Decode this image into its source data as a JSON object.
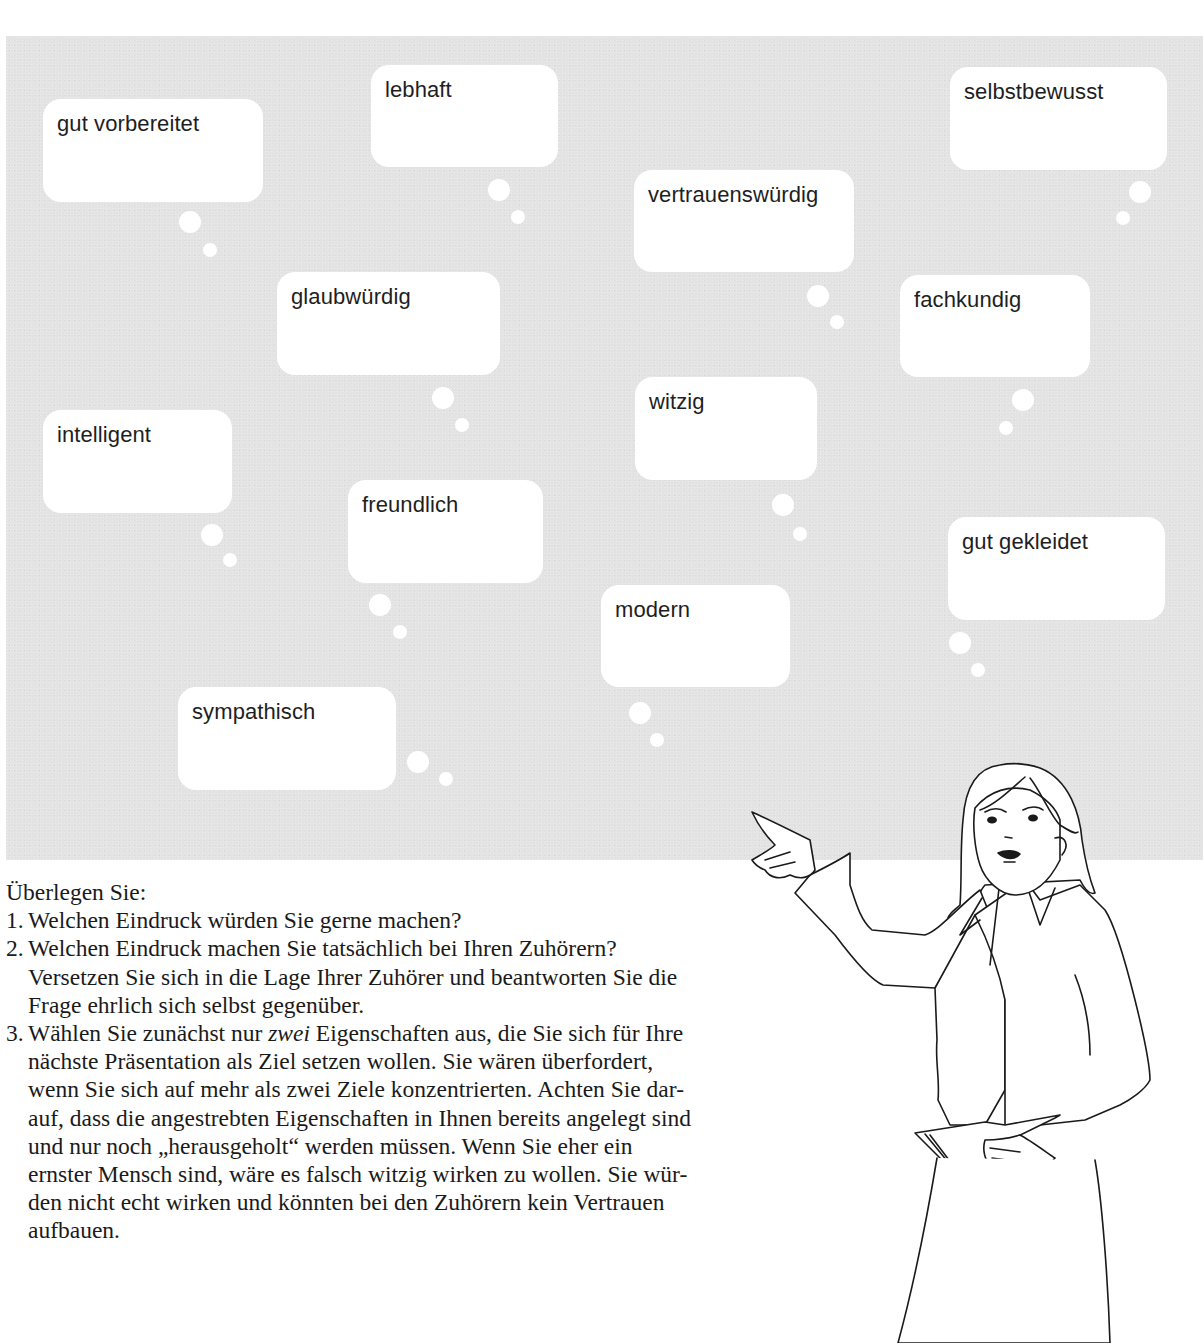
{
  "panel": {
    "background_color": "#e3e3e3",
    "bubble_color": "#ffffff",
    "bubbles": [
      {
        "label": "gut vorbereitet",
        "x": 43,
        "y": 99,
        "w": 220,
        "h": 103,
        "dots": [
          [
            190,
            222,
            11
          ],
          [
            210,
            250,
            7
          ]
        ]
      },
      {
        "label": "lebhaft",
        "x": 371,
        "y": 65,
        "w": 187,
        "h": 102,
        "dots": [
          [
            499,
            190,
            11
          ],
          [
            518,
            217,
            7
          ]
        ]
      },
      {
        "label": "selbstbewusst",
        "x": 950,
        "y": 67,
        "w": 217,
        "h": 103,
        "dots": [
          [
            1140,
            192,
            11
          ],
          [
            1123,
            218,
            7
          ]
        ]
      },
      {
        "label": "vertrauenswürdig",
        "x": 634,
        "y": 170,
        "w": 220,
        "h": 102,
        "dots": [
          [
            818,
            296,
            11
          ],
          [
            837,
            322,
            7
          ]
        ]
      },
      {
        "label": "glaubwürdig",
        "x": 277,
        "y": 272,
        "w": 223,
        "h": 103,
        "dots": [
          [
            443,
            398,
            11
          ],
          [
            462,
            425,
            7
          ]
        ]
      },
      {
        "label": "fachkundig",
        "x": 900,
        "y": 275,
        "w": 190,
        "h": 102,
        "dots": [
          [
            1023,
            400,
            11
          ],
          [
            1006,
            428,
            7
          ]
        ]
      },
      {
        "label": "intelligent",
        "x": 43,
        "y": 410,
        "w": 189,
        "h": 103,
        "dots": [
          [
            212,
            535,
            11
          ],
          [
            230,
            560,
            7
          ]
        ]
      },
      {
        "label": "witzig",
        "x": 635,
        "y": 377,
        "w": 182,
        "h": 103,
        "dots": [
          [
            783,
            505,
            11
          ],
          [
            800,
            534,
            7
          ]
        ]
      },
      {
        "label": "freundlich",
        "x": 348,
        "y": 480,
        "w": 195,
        "h": 103,
        "dots": [
          [
            380,
            605,
            11
          ],
          [
            400,
            632,
            7
          ]
        ]
      },
      {
        "label": "gut gekleidet",
        "x": 948,
        "y": 517,
        "w": 217,
        "h": 103,
        "dots": [
          [
            960,
            643,
            11
          ],
          [
            978,
            670,
            7
          ]
        ]
      },
      {
        "label": "modern",
        "x": 601,
        "y": 585,
        "w": 189,
        "h": 102,
        "dots": [
          [
            640,
            713,
            11
          ],
          [
            657,
            740,
            7
          ]
        ]
      },
      {
        "label": "sympathisch",
        "x": 178,
        "y": 687,
        "w": 218,
        "h": 103,
        "dots": [
          [
            418,
            762,
            11
          ],
          [
            446,
            779,
            7
          ]
        ]
      }
    ]
  },
  "text": {
    "intro": "Überlegen Sie:",
    "items": [
      {
        "num": "1.",
        "lines": [
          "Welchen Eindruck würden Sie gerne machen?"
        ]
      },
      {
        "num": "2.",
        "lines": [
          "Welchen Eindruck machen Sie tatsächlich bei Ihren Zuhörern?",
          "Versetzen Sie sich in die Lage Ihrer Zuhörer und beantworten Sie die",
          "Frage ehrlich sich selbst gegenüber."
        ]
      },
      {
        "num": "3.",
        "line1_pre": "Wählen Sie zunächst nur ",
        "line1_em": "zwei",
        "line1_post": " Eigenschaften aus, die Sie sich für Ihre",
        "lines": [
          "nächste Präsentation als Ziel setzen wollen. Sie wären überfordert,",
          "wenn Sie sich auf mehr als zwei Ziele konzentrierten. Achten Sie dar-",
          "auf, dass die angestrebten Eigenschaften in Ihnen bereits angelegt sind",
          "und nur noch „herausgeholt“ werden müssen. Wenn Sie eher ein",
          "ernster Mensch sind, wäre es falsch witzig wirken zu wollen. Sie wür-",
          "den nicht echt wirken und könnten bei den Zuhörern kein Vertrauen",
          "aufbauen."
        ]
      }
    ]
  },
  "illustration": {
    "subject": "woman-presenter-pointing",
    "holding": "papers"
  }
}
